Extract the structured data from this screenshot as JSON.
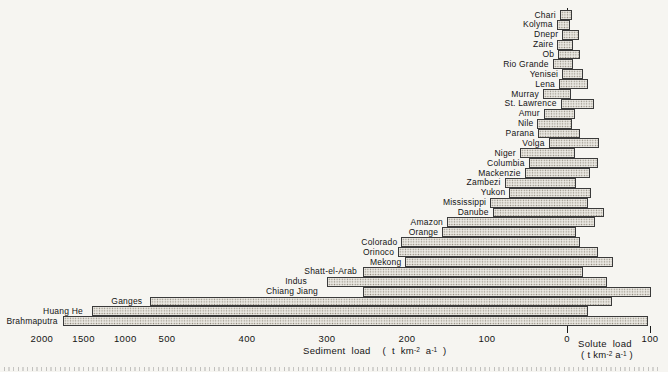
{
  "figure": {
    "background": "#f6f5f1",
    "bar_fill": "#eae8e2",
    "bar_border": "#3a3a3a",
    "axis_color": "#1b1b1b"
  },
  "axis": {
    "sediment": {
      "text": "Sediment load",
      "unit_pre": "( t km",
      "unit_sup1": "-2",
      "unit_mid": " a",
      "unit_sup2": "-1",
      "unit_post": " )"
    },
    "solute": {
      "text": "Solute load",
      "unit_pre": "( t km",
      "unit_sup1": "-2",
      "unit_mid": " a",
      "unit_sup2": "-1",
      "unit_post": " )"
    }
  },
  "chart_data": {
    "type": "bar",
    "orientation": "horizontal-diverging",
    "left_axis_label": "Sediment load (t km-2 a-1)",
    "right_axis_label": "Solute load (t km-2 a-1)",
    "axis_note": "sediment axis linear 0-500, compressed 500-2000; solute axis linear 0-100",
    "categories": [
      "Chari",
      "Kolyma",
      "Dnepr",
      "Zaire",
      "Ob",
      "Rio Grande",
      "Yenisei",
      "Lena",
      "Murray",
      "St. Lawrence",
      "Amur",
      "Nile",
      "Parana",
      "Volga",
      "Niger",
      "Columbia",
      "Mackenzie",
      "Zambezi",
      "Yukon",
      "Mississippi",
      "Danube",
      "Amazon",
      "Orange",
      "Colorado",
      "Orinoco",
      "Mekong",
      "Shatt-el-Arab",
      "Indus",
      "Chiang Jiang",
      "Ganges",
      "Huang He",
      "Brahmaputra"
    ],
    "series": [
      {
        "name": "Sediment load (t km-2 a-1)",
        "values": [
          9,
          13,
          6,
          12,
          11,
          18,
          6,
          10,
          30,
          8,
          29,
          37,
          36,
          23,
          59,
          48,
          53,
          78,
          72,
          96,
          93,
          150,
          156,
          207,
          211,
          202,
          255,
          300,
          255,
          700,
          1400,
          1750
        ]
      },
      {
        "name": "Solute load (t km-2 a-1)",
        "values": [
          6,
          4,
          15,
          7,
          16,
          7,
          19,
          25,
          5,
          33,
          10,
          6,
          16,
          39,
          10,
          37,
          28,
          11,
          29,
          25,
          45,
          34,
          11,
          16,
          37,
          56,
          19,
          48,
          101,
          54,
          25,
          97
        ]
      }
    ],
    "sediment_ticks": [
      {
        "label": "2000",
        "value": 2000
      },
      {
        "label": "1500",
        "value": 1500
      },
      {
        "label": "1000",
        "value": 1000
      },
      {
        "label": "500",
        "value": 500
      },
      {
        "label": "400",
        "value": 400
      },
      {
        "label": "300",
        "value": 300
      },
      {
        "label": "200",
        "value": 200
      },
      {
        "label": "100",
        "value": 100
      },
      {
        "label": "0",
        "value": 0
      }
    ],
    "solute_ticks": [
      {
        "label": "100",
        "value": 100
      }
    ],
    "layout": {
      "zero_x": 567,
      "first_row_y": 10,
      "row_pitch": 9.88,
      "bar_h": 9.9,
      "sed_px_per_unit": 0.8,
      "sed_linear_max": 500,
      "sed_px_compressed": 0.0834,
      "sol_px_per_unit": 0.83,
      "label_gaps": [
        4,
        4,
        4,
        4,
        4,
        4,
        4,
        4,
        4,
        4,
        4,
        4,
        4,
        4,
        4,
        4,
        4,
        4,
        4,
        4,
        4,
        4,
        4,
        4,
        4,
        4,
        6,
        20,
        45,
        8,
        9,
        5
      ]
    }
  }
}
